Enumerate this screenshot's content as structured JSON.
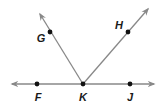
{
  "diagram": {
    "type": "geometry-rays",
    "line_color": "#888888",
    "point_color": "#111111",
    "vertex": {
      "label": "K",
      "x": 83,
      "y": 84
    },
    "line": {
      "name": "line FJ",
      "from": [
        12,
        84
      ],
      "to": [
        154,
        84
      ],
      "arrows": "both"
    },
    "rays": [
      {
        "name": "ray KG",
        "from": [
          83,
          84
        ],
        "to": [
          40,
          14
        ]
      },
      {
        "name": "ray KH",
        "from": [
          83,
          84
        ],
        "to": [
          148,
          9
        ]
      }
    ],
    "points": [
      {
        "label": "F",
        "x": 37,
        "y": 84,
        "lx": 38,
        "ly": 101
      },
      {
        "label": "K",
        "x": 83,
        "y": 84,
        "lx": 83,
        "ly": 101
      },
      {
        "label": "J",
        "x": 130,
        "y": 84,
        "lx": 130,
        "ly": 101
      },
      {
        "label": "G",
        "x": 50,
        "y": 32,
        "lx": 41,
        "ly": 42
      },
      {
        "label": "H",
        "x": 128,
        "y": 32,
        "lx": 119,
        "ly": 29
      }
    ]
  }
}
